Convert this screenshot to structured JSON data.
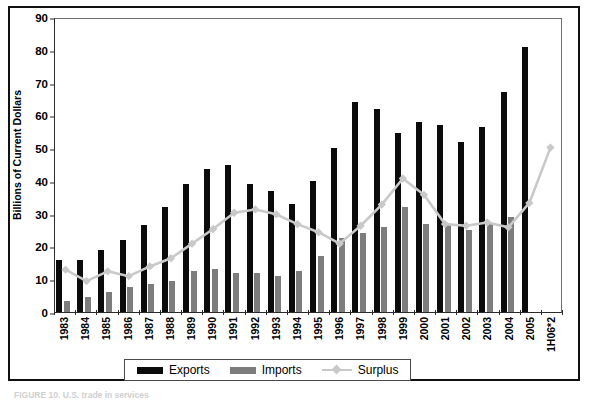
{
  "figure": {
    "y_axis_title": "Billions of Current Dollars",
    "bottom_caption": "FIGURE 10. U.S. trade in services",
    "legend": {
      "exports_label": "Exports",
      "imports_label": "Imports",
      "surplus_label": "Surplus"
    },
    "colors": {
      "exports": "#0b0b0b",
      "imports": "#7d7d7d",
      "surplus": "#c9c9c9",
      "frame": "#111111",
      "axis": "#2b2b2b"
    }
  },
  "chart_data": {
    "type": "bar",
    "title": "",
    "subtitle": "",
    "xlabel": "",
    "ylabel": "Billions of Current Dollars",
    "ylim": [
      0,
      90
    ],
    "ytick_step": 10,
    "yticks": [
      0,
      10,
      20,
      30,
      40,
      50,
      60,
      70,
      80,
      90
    ],
    "grid": false,
    "legend_position": "bottom",
    "categories": [
      "1983",
      "1984",
      "1985",
      "1986",
      "1987",
      "1988",
      "1989",
      "1990",
      "1991",
      "1992",
      "1993",
      "1994",
      "1995",
      "1996",
      "1997",
      "1998",
      "1999",
      "2000",
      "2001",
      "2002",
      "2003",
      "2004",
      "2005",
      "1H06*2"
    ],
    "series": [
      {
        "name": "Exports",
        "type": "bar",
        "color": "#0b0b0b",
        "values": [
          16,
          16,
          19,
          22,
          26.5,
          32,
          39,
          43.5,
          45,
          39,
          37,
          33,
          40,
          50,
          64,
          62,
          54.5,
          58,
          57,
          52,
          56.5,
          67,
          81,
          0
        ]
      },
      {
        "name": "Imports",
        "type": "bar",
        "color": "#7d7d7d",
        "values": [
          3.5,
          4.5,
          6,
          7.5,
          8.5,
          9.5,
          12.5,
          13,
          12,
          12,
          11,
          12.5,
          17,
          22.5,
          24,
          26,
          32,
          27,
          27,
          25,
          27,
          29,
          0,
          0
        ]
      },
      {
        "name": "Surplus",
        "type": "line",
        "color": "#c9c9c9",
        "marker": "diamond",
        "values": [
          13,
          9.5,
          12.5,
          11,
          14,
          16.5,
          21,
          25.5,
          30.5,
          31.5,
          30,
          27,
          24.5,
          21,
          26.5,
          33,
          41,
          36,
          27,
          26.5,
          27.5,
          26,
          33.5,
          50.5
        ]
      }
    ]
  }
}
